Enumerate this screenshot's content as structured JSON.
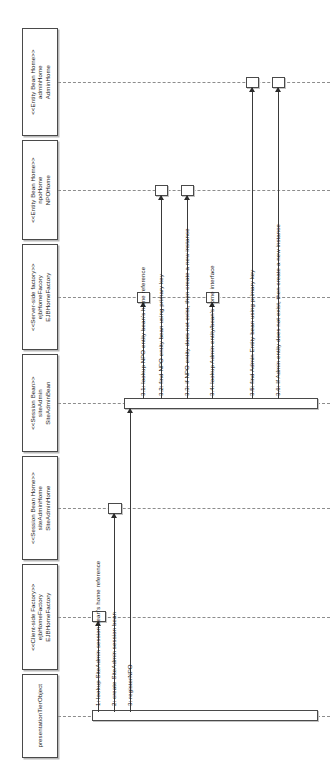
{
  "diagram": {
    "kind": "uml-sequence-diagram",
    "orientation": "rotated-90-counterclockwise",
    "background": "#ffffff",
    "line_color": "#4a4a4a",
    "text_color": "#1a1a1a"
  },
  "lifelines": [
    {
      "id": "adminHome",
      "stereotype": "<<Entity Bean Home>>",
      "instance": "adminHome",
      "classname": "AdminHome"
    },
    {
      "id": "npoHome",
      "stereotype": "<<Entity Bean Home>>",
      "instance": "npoHome",
      "classname": "NPOHome"
    },
    {
      "id": "serverEjbHomeFactory",
      "stereotype": "<<Server-side factory>>",
      "instance": "ejbHomeFacory",
      "classname": "EJBHomeFactory"
    },
    {
      "id": "siteAdminBean",
      "stereotype": "<<Session Bean>>",
      "instance": "siteAdmin",
      "classname": "SiteAdminBean"
    },
    {
      "id": "siteAdminHome",
      "stereotype": "<<Session Bean Home>>",
      "instance": "siteAdminHome",
      "classname": "SiteAdminHome"
    },
    {
      "id": "clientEjbHomeFactory",
      "stereotype": "<<Client-side Factory>>",
      "instance": "ejbHomeFactory",
      "classname": "EJBHomeFactory"
    },
    {
      "id": "presentationTierObject",
      "stereotype": "",
      "instance": "presentationTierObject",
      "classname": ""
    }
  ],
  "messages": [
    {
      "seq": "1",
      "label": "1: lookup SiteAdmin session bean's home reference",
      "from": "presentationTierObject",
      "to": "clientEjbHomeFactory"
    },
    {
      "seq": "2",
      "label": "2: create SiteAdmin session bean",
      "from": "presentationTierObject",
      "to": "siteAdminHome"
    },
    {
      "seq": "3",
      "label": "3: registerNPO",
      "from": "presentationTierObject",
      "to": "siteAdminBean"
    },
    {
      "seq": "3.1",
      "label": "3.1: lookup NPO entity bean's home reference",
      "from": "siteAdminBean",
      "to": "serverEjbHomeFactory"
    },
    {
      "seq": "3.2",
      "label": "3.2: find NPO entity bean using primary key",
      "from": "siteAdminBean",
      "to": "npoHome"
    },
    {
      "seq": "3.3",
      "label": "3.3: if NPO entity does not exist, then create a new instance",
      "from": "siteAdminBean",
      "to": "npoHome"
    },
    {
      "seq": "3.4",
      "label": "3.4: lookup Admin entity/bean's home interface",
      "from": "siteAdminBean",
      "to": "serverEjbHomeFactory"
    },
    {
      "seq": "3.5",
      "label": "3.5: find Admin Entity bean using primary key",
      "from": "siteAdminBean",
      "to": "adminHome"
    },
    {
      "seq": "3.6",
      "label": "3.6: If Admin entity does not exist, then create a new instance",
      "from": "siteAdminBean",
      "to": "adminHome"
    }
  ]
}
